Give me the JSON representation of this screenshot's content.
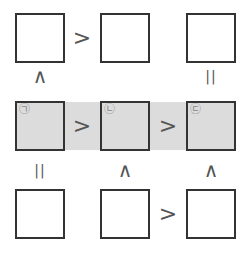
{
  "puzzle": {
    "rows": [
      [
        {
          "label": ""
        },
        {
          "label": ""
        },
        {
          "label": ""
        }
      ],
      [
        {
          "label": "㉠",
          "shaded": true
        },
        {
          "label": "㉡",
          "shaded": true
        },
        {
          "label": "㉢",
          "shaded": true
        }
      ],
      [
        {
          "label": ""
        },
        {
          "label": ""
        },
        {
          "label": ""
        }
      ]
    ],
    "horizontal_relations": {
      "row1_c1_c2": ">",
      "row1_c2_c3": "",
      "row2_c1_c2": ">",
      "row2_c2_c3": ">",
      "row3_c1_c2": "",
      "row3_c2_c3": ">"
    },
    "vertical_relations": {
      "c1_r1_r2": "∧",
      "c2_r1_r2": "",
      "c3_r1_r2": "||",
      "c1_r2_r3": "||",
      "c2_r2_r3": "∧",
      "c3_r2_r3": "∧"
    },
    "colors": {
      "border": "#333333",
      "shade": "#dcdcdc",
      "symbol": "#555555",
      "label": "#888888"
    }
  }
}
